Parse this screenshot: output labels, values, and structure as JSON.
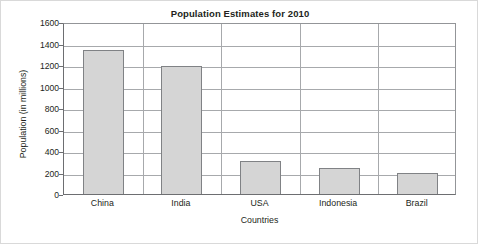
{
  "chart_data": {
    "type": "bar",
    "title": "Population Estimates for 2010",
    "xlabel": "Countries",
    "ylabel": "Population (in millions)",
    "categories": [
      "China",
      "India",
      "USA",
      "Indonesia",
      "Brazil"
    ],
    "values": [
      1340,
      1190,
      310,
      240,
      195
    ],
    "series": [
      {
        "name": "Population",
        "values": [
          1340,
          1190,
          310,
          240,
          195
        ]
      }
    ],
    "ylim": [
      0,
      1600
    ],
    "ytick_labels": [
      "0",
      "200",
      "400",
      "600",
      "800",
      "1000",
      "1200",
      "1400",
      "1600"
    ],
    "ytick_values": [
      0,
      200,
      400,
      600,
      800,
      1000,
      1200,
      1400,
      1600
    ],
    "grid": "horizontal",
    "legend": "none",
    "bar_fill_color": "#d5d5d5",
    "bar_border_color": "#808285",
    "gridline_color": "#a7a9ac",
    "axis_color": "#6d6e71",
    "text_color": "#231f20"
  }
}
